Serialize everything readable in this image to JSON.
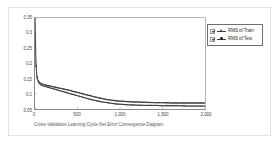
{
  "chart_data": {
    "type": "line",
    "title": "",
    "caption": "Cross-Validation Learning Cycle Net Error Convergence Diagram",
    "xlabel": "",
    "ylabel": "",
    "xlim": [
      0,
      2000
    ],
    "ylim": [
      0.05,
      0.35
    ],
    "grid": false,
    "legend_position": "right-top",
    "x_ticks": [
      "0",
      "500",
      "1,000",
      "1,500",
      "2,000"
    ],
    "x_tick_values": [
      0,
      500,
      1000,
      1500,
      2000
    ],
    "y_ticks": [
      "0.35",
      "0.3",
      "0.25",
      "0.2",
      "0.15",
      "0.1",
      "0.05"
    ],
    "y_tick_values": [
      0.35,
      0.3,
      0.25,
      0.2,
      0.15,
      0.1,
      0.05
    ],
    "x": [
      0,
      10,
      20,
      30,
      40,
      50,
      60,
      80,
      100,
      125,
      150,
      175,
      200,
      250,
      300,
      350,
      400,
      450,
      500,
      550,
      600,
      650,
      700,
      750,
      800,
      850,
      900,
      950,
      1000,
      1100,
      1200,
      1300,
      1400,
      1500,
      1600,
      1700,
      1800,
      1900,
      2000
    ],
    "series": [
      {
        "name": "RMS of Train",
        "marker": "triangle",
        "color": "#2e2e2e",
        "values": [
          0.352,
          0.205,
          0.162,
          0.146,
          0.138,
          0.134,
          0.131,
          0.128,
          0.126,
          0.124,
          0.122,
          0.12,
          0.118,
          0.114,
          0.11,
          0.106,
          0.102,
          0.098,
          0.094,
          0.09,
          0.086,
          0.082,
          0.079,
          0.076,
          0.073,
          0.071,
          0.069,
          0.067,
          0.066,
          0.064,
          0.063,
          0.062,
          0.062,
          0.061,
          0.061,
          0.061,
          0.06,
          0.06,
          0.06
        ]
      },
      {
        "name": "RMS of Test",
        "marker": "dot",
        "color": "#3c3c3c",
        "values": [
          0.352,
          0.208,
          0.166,
          0.15,
          0.143,
          0.139,
          0.136,
          0.133,
          0.131,
          0.129,
          0.127,
          0.126,
          0.124,
          0.121,
          0.118,
          0.115,
          0.112,
          0.108,
          0.105,
          0.101,
          0.097,
          0.094,
          0.09,
          0.087,
          0.084,
          0.081,
          0.079,
          0.077,
          0.076,
          0.074,
          0.073,
          0.072,
          0.071,
          0.071,
          0.07,
          0.07,
          0.07,
          0.07,
          0.07
        ]
      }
    ]
  },
  "legend": {
    "items": [
      {
        "label": "RMS of Train",
        "checked": true
      },
      {
        "label": "RMS of Test",
        "checked": true
      }
    ]
  }
}
